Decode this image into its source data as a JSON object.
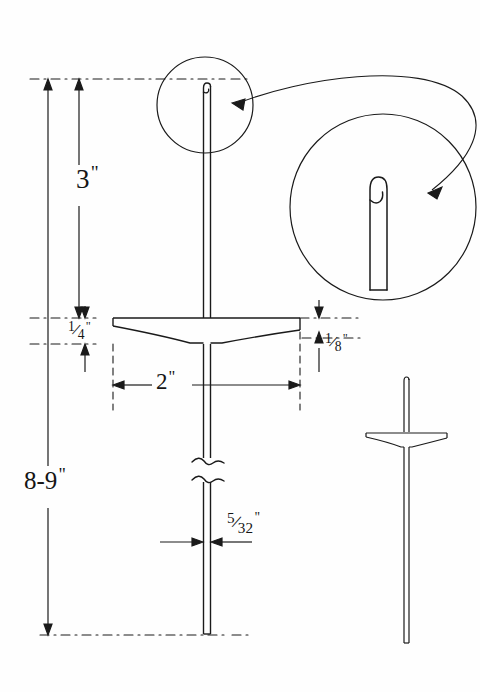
{
  "drawing": {
    "title": "Hooked rod tool with crossbar - dimensioned shop drawing",
    "subject": "latch hook tool",
    "ink_color": "#151515",
    "paper_color": "#fefefe",
    "units": "inches"
  },
  "dimensions": {
    "upper_shaft": {
      "name": "3-inch-dimension",
      "value": "3",
      "unit_mark": "\"",
      "description": "distance from hooked tip to top of crossbar"
    },
    "crossbar_thickness": {
      "name": "quarter-inch-dimension",
      "numerator": "1",
      "denominator": "4",
      "unit_mark": "\"",
      "description": "crossbar total thickness at center"
    },
    "crossbar_edge": {
      "name": "eighth-inch-dimension",
      "numerator": "1",
      "denominator": "8",
      "unit_mark": "\"",
      "description": "crossbar thickness at outer edge"
    },
    "crossbar_width": {
      "name": "two-inch-dimension",
      "value": "2",
      "unit_mark": "\"",
      "description": "overall crossbar width"
    },
    "rod_diameter": {
      "name": "five-thirtyseconds-dimension",
      "numerator": "5",
      "denominator": "32",
      "unit_mark": "\"",
      "description": "rod stock diameter"
    },
    "overall_length": {
      "name": "eight-to-nine-inch-dimension",
      "value": "8-9",
      "unit_mark": "\"",
      "description": "overall tool length, tip to bottom"
    }
  },
  "views": {
    "main": {
      "name": "main-elevation-view"
    },
    "detail_small": {
      "name": "detail-circle-small",
      "note": "hooked tip shown at scale"
    },
    "detail_large": {
      "name": "detail-circle-enlarged",
      "note": "hooked tip enlarged"
    },
    "side": {
      "name": "reduced-side-view"
    }
  },
  "annotations": {
    "leader": {
      "name": "detail-leader-arrow",
      "note": "curved double-headed leader linking detail circles"
    },
    "break": {
      "name": "break-symbol",
      "note": "conventional break in shaft"
    }
  }
}
